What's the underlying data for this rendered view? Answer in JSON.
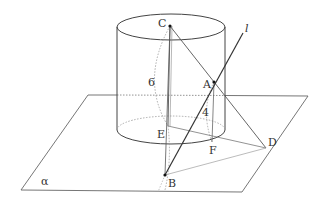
{
  "diagram": {
    "type": "geometry-3d",
    "plane_label": "α",
    "line_label": "l",
    "points": {
      "A": {
        "label": "A",
        "x": 214,
        "y": 82
      },
      "B": {
        "label": "B",
        "x": 165,
        "y": 175
      },
      "C": {
        "label": "C",
        "x": 170,
        "y": 26
      },
      "D": {
        "label": "D",
        "x": 266,
        "y": 148
      },
      "E": {
        "label": "E",
        "x": 168,
        "y": 126
      },
      "F": {
        "label": "F",
        "x": 212,
        "y": 142
      }
    },
    "measurements": {
      "height_label": "6",
      "segment_label": "4"
    },
    "colors": {
      "line": "#555555",
      "dashed": "#999999",
      "text": "#333333"
    }
  }
}
